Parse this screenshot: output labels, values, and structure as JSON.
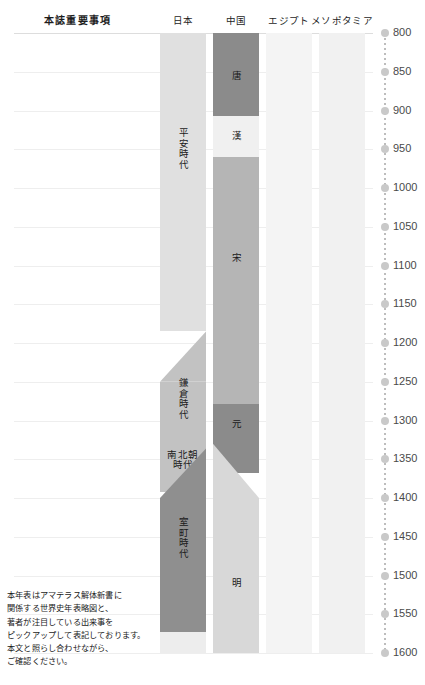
{
  "header": {
    "title": "本誌重要事項",
    "columns": [
      {
        "label": "日本",
        "key": "japan"
      },
      {
        "label": "中国",
        "key": "china"
      },
      {
        "label": "エジプト",
        "key": "egypt"
      },
      {
        "label": "メソポタミア",
        "key": "mesopotamia"
      }
    ]
  },
  "axis": {
    "start_year": 800,
    "end_year": 1600,
    "step": 50,
    "ticks": [
      "800",
      "850",
      "900",
      "950",
      "1000",
      "1050",
      "1100",
      "1150",
      "1200",
      "1250",
      "1300",
      "1350",
      "1400",
      "1450",
      "1500",
      "1550",
      "1600"
    ],
    "marker_color": "#c9c9c9",
    "line_color": "#bdbdbd"
  },
  "columns": [
    {
      "key": "japan",
      "label": "日本",
      "x": 160,
      "width": 46,
      "bands": [
        {
          "name": "heian",
          "label": "平安時代",
          "from": 800,
          "to": 1185,
          "color": "#e0e0e0",
          "shape": "rect",
          "label_year": 950,
          "vertical": true
        },
        {
          "name": "kamakura-transition",
          "label": "",
          "from": 1185,
          "to": 1250,
          "color": "#c2c2c2",
          "shape": "diag-lr",
          "label_year": 0,
          "vertical": false
        },
        {
          "name": "kamakura",
          "label": "鎌倉時代",
          "from": 1250,
          "to": 1336,
          "color": "#c2c2c2",
          "shape": "rect",
          "label_year": 1272,
          "vertical": true
        },
        {
          "name": "nanbokucho",
          "label": "南北朝\n時代",
          "from": 1336,
          "to": 1392,
          "color": "#c2c2c2",
          "shape": "rect",
          "label_year": 1352,
          "vertical": false
        },
        {
          "name": "muromachi-transition",
          "label": "",
          "from": 1336,
          "to": 1400,
          "color": "#8f8f8f",
          "shape": "diag-lr2",
          "label_year": 0,
          "vertical": false
        },
        {
          "name": "muromachi",
          "label": "室町時代",
          "from": 1400,
          "to": 1573,
          "color": "#8f8f8f",
          "shape": "rect",
          "label_year": 1452,
          "vertical": true
        },
        {
          "name": "azuchi",
          "label": "",
          "from": 1573,
          "to": 1600,
          "color": "#ededed",
          "shape": "rect",
          "label_year": 0,
          "vertical": false
        }
      ]
    },
    {
      "key": "china",
      "label": "中国",
      "x": 213,
      "width": 46,
      "bands": [
        {
          "name": "tang",
          "label": "唐",
          "from": 800,
          "to": 907,
          "color": "#8b8b8b",
          "shape": "rect",
          "label_year": 855,
          "vertical": true
        },
        {
          "name": "han",
          "label": "漢",
          "from": 907,
          "to": 960,
          "color": "#f0f0f0",
          "shape": "rect",
          "label_year": 933,
          "vertical": true
        },
        {
          "name": "song",
          "label": "宋",
          "from": 960,
          "to": 1279,
          "color": "#b5b5b5",
          "shape": "rect",
          "label_year": 1090,
          "vertical": true
        },
        {
          "name": "yuan",
          "label": "元",
          "from": 1279,
          "to": 1368,
          "color": "#8b8b8b",
          "shape": "rect",
          "label_year": 1305,
          "vertical": true
        },
        {
          "name": "yuan-transition",
          "label": "",
          "from": 1330,
          "to": 1400,
          "color": "#d8d8d8",
          "shape": "diag-rl",
          "label_year": 0,
          "vertical": false
        },
        {
          "name": "ming",
          "label": "明",
          "from": 1400,
          "to": 1600,
          "color": "#d8d8d8",
          "shape": "rect",
          "label_year": 1510,
          "vertical": true
        }
      ]
    },
    {
      "key": "egypt",
      "label": "エジプト",
      "x": 266,
      "width": 46,
      "bands": [
        {
          "name": "egypt-era",
          "label": "",
          "from": 800,
          "to": 1600,
          "color": "#f4f4f4",
          "shape": "rect",
          "label_year": 0,
          "vertical": false
        }
      ]
    },
    {
      "key": "mesopotamia",
      "label": "メソポタミア",
      "x": 319,
      "width": 46,
      "bands": [
        {
          "name": "mesopotamia-era",
          "label": "",
          "from": 800,
          "to": 1600,
          "color": "#f1f1f1",
          "shape": "rect",
          "label_year": 0,
          "vertical": false
        }
      ]
    }
  ],
  "caption": {
    "lines": [
      "本年表はアマテラス解体新書に",
      "関係する世界史年表略図と、",
      "著者が注目している出来事を",
      "ピックアップして表記しております。",
      "本文と照らし合わせながら、",
      "ご確認ください。"
    ]
  }
}
